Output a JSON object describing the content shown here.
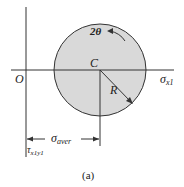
{
  "diagram": {
    "labels": {
      "origin": "O",
      "center": "C",
      "radius": "R",
      "angle": "2θ",
      "sigma_axis": "σ",
      "sigma_axis_sub": "x1",
      "tau_axis": "τ",
      "tau_axis_sub": "x1y1",
      "sigma_aver": "σ",
      "sigma_aver_sub": "aver",
      "caption": "(a)"
    },
    "colors": {
      "circle_fill": "#d9d9d9",
      "line": "#333333"
    }
  }
}
